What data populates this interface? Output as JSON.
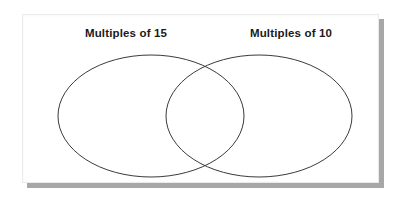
{
  "diagram": {
    "type": "venn",
    "title": "",
    "background_color": "#ffffff",
    "card_color": "#ffffff",
    "stroke_color": "#3a3a40",
    "text_color": "#1a1a1a",
    "sets": [
      {
        "id": "left",
        "label": "Multiples of 15",
        "shape": "ellipse",
        "cx": 151,
        "cy": 116,
        "rx": 93,
        "ry": 61,
        "members": []
      },
      {
        "id": "right",
        "label": "Multiples of 10",
        "shape": "ellipse",
        "cx": 259,
        "cy": 116,
        "rx": 93,
        "ry": 61,
        "members": []
      }
    ],
    "intersection": {
      "label": "",
      "members": []
    }
  }
}
